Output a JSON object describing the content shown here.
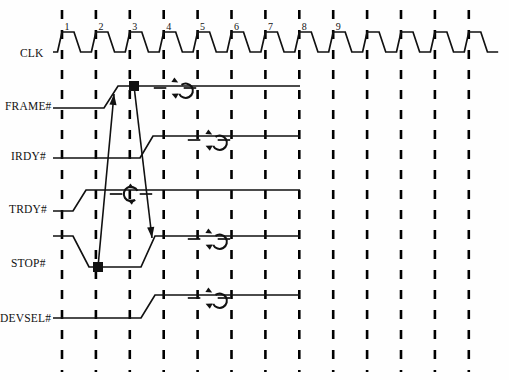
{
  "diagram": {
    "type": "digital-timing-waveform",
    "background_color": "#ffffff",
    "line_color": "#111111",
    "dash_color": "#000000",
    "canvas": {
      "width": 509,
      "height": 380
    }
  },
  "time_axis": {
    "first_line_x": 62,
    "spacing_px": 33.9,
    "grid_line_count": 13,
    "grid_top": 10,
    "grid_bottom": 372,
    "cycle_labels": [
      "1",
      "2",
      "3",
      "4",
      "5",
      "6",
      "7",
      "8",
      "9"
    ]
  },
  "signals": [
    {
      "name": "CLK",
      "label": "CLK",
      "label_x": 20,
      "label_y": 58,
      "row_high_y": 32,
      "row_low_y": 52,
      "kind": "clock",
      "cycles": 13
    },
    {
      "name": "FRAME#",
      "label": "FRAME#",
      "label_x": 5,
      "label_y": 111,
      "row_high_y": 86,
      "row_low_y": 108,
      "kind": "waveform",
      "transitions": [
        {
          "type": "rise",
          "from_x": 104,
          "to_x": 118,
          "at_cycle": 2.25
        }
      ],
      "start_level": "low",
      "end_level": "high",
      "marker": {
        "type": "square",
        "x": 134,
        "y": 86
      },
      "annotation": {
        "type": "rotate-cw-icon",
        "cx": 175,
        "cy": 88
      }
    },
    {
      "name": "IRDY#",
      "label": "IRDY#",
      "label_x": 11,
      "label_y": 161,
      "row_high_y": 136,
      "row_low_y": 158,
      "kind": "waveform",
      "transitions": [
        {
          "type": "rise",
          "from_x": 140,
          "to_x": 153,
          "at_cycle": 3.3
        }
      ],
      "start_level": "low",
      "end_level": "high",
      "annotation": {
        "type": "rotate-cw-icon",
        "cx": 209,
        "cy": 140
      }
    },
    {
      "name": "TRDY#",
      "label": "TRDY#",
      "label_x": 9,
      "label_y": 214,
      "row_high_y": 190,
      "row_low_y": 211,
      "kind": "waveform",
      "transitions": [
        {
          "type": "rise",
          "from_x": 73,
          "to_x": 86,
          "at_cycle": 1.4
        }
      ],
      "start_level": "low",
      "end_level": "high",
      "annotation": {
        "type": "rotate-ccw-icon",
        "cx": 131,
        "cy": 194
      }
    },
    {
      "name": "STOP#",
      "label": "STOP#",
      "label_x": 11,
      "label_y": 268,
      "row_high_y": 236,
      "row_low_y": 267,
      "kind": "waveform",
      "transitions": [
        {
          "type": "fall",
          "from_x": 73,
          "to_x": 89,
          "at_cycle": 1.4
        },
        {
          "type": "rise",
          "from_x": 141,
          "to_x": 155,
          "at_cycle": 3.3
        }
      ],
      "start_level": "high",
      "end_level": "high",
      "marker": {
        "type": "square",
        "x": 98,
        "y": 267
      },
      "annotation": {
        "type": "rotate-cw-icon",
        "cx": 209,
        "cy": 239
      }
    },
    {
      "name": "DEVSEL#",
      "label": "DEVSEL#",
      "label_x": 0,
      "label_y": 323,
      "row_high_y": 295,
      "row_low_y": 318,
      "kind": "waveform",
      "transitions": [
        {
          "type": "rise",
          "from_x": 141,
          "to_x": 155,
          "at_cycle": 3.3
        }
      ],
      "start_level": "low",
      "end_level": "high",
      "annotation": {
        "type": "rotate-cw-icon",
        "cx": 209,
        "cy": 298
      }
    }
  ],
  "causal_arrows": [
    {
      "name": "stop-to-frame",
      "from": {
        "x": 98,
        "y": 267
      },
      "to": {
        "x": 114,
        "y": 94
      },
      "direction": "up",
      "description": "STOP# assertion causes FRAME# deassertion"
    },
    {
      "name": "frame-to-stop",
      "from": {
        "x": 134,
        "y": 86
      },
      "to": {
        "x": 152,
        "y": 238
      },
      "direction": "down",
      "description": "FRAME# deassertion causes STOP# deassertion"
    }
  ]
}
